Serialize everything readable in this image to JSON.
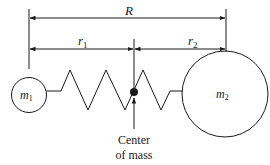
{
  "diagram": {
    "labels": {
      "R": "R",
      "r1_main": "r",
      "r1_sub": "1",
      "r2_main": "r",
      "r2_sub": "2",
      "m1_main": "m",
      "m1_sub": "1",
      "m2_main": "m",
      "m2_sub": "2",
      "com_line1": "Center",
      "com_line2": "of mass"
    },
    "colors": {
      "stroke": "#1a1a1a",
      "background": "#ffffff"
    }
  }
}
